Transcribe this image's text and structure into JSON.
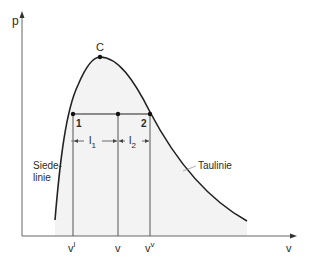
{
  "diagram": {
    "type": "p-v phase diagram",
    "axes": {
      "y_label": "p",
      "x_label": "v"
    },
    "critical_point": {
      "label": "C"
    },
    "points": [
      {
        "label": "1"
      },
      {
        "label": "2"
      }
    ],
    "segments": {
      "l1_main": "l",
      "l1_sub": "1",
      "l2_main": "l",
      "l2_sub": "2"
    },
    "x_ticks": {
      "v_liquid_main": "v",
      "v_liquid_sup": "l",
      "v_main": "v",
      "v_vapor_main": "v",
      "v_vapor_sup": "v"
    },
    "curve_labels": {
      "boiling_line_1": "Siede-",
      "boiling_line_2": "linie",
      "dew_line": "Taulinie"
    },
    "colors": {
      "line": "#222222",
      "axis": "#555555",
      "shade": "#f2f2f2",
      "vertical": "#666666"
    }
  }
}
